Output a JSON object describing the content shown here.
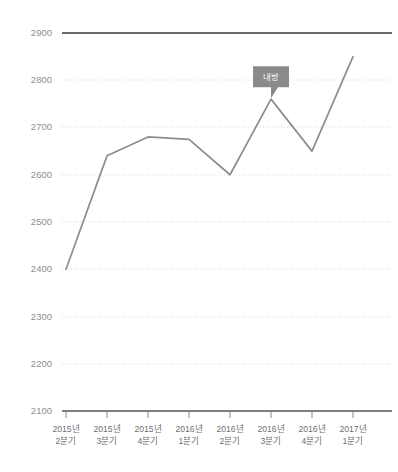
{
  "chart_data": {
    "type": "line",
    "title": "",
    "subtitle": "",
    "xlabel": "",
    "ylabel": "",
    "categories": [
      "2015년\n2분기",
      "2015년\n3분기",
      "2015년\n4분기",
      "2016년\n1분기",
      "2016년\n2분기",
      "2016년\n3분기",
      "2016년\n4분기",
      "2017년\n1분기"
    ],
    "categories_line1": [
      "2015년",
      "2015년",
      "2015년",
      "2016년",
      "2016년",
      "2016년",
      "2016년",
      "2017년"
    ],
    "categories_line2": [
      "2분기",
      "3분기",
      "4분기",
      "1분기",
      "2분기",
      "3분기",
      "4분기",
      "1분기"
    ],
    "values": [
      2400,
      2640,
      2680,
      2675,
      2600,
      2760,
      2650,
      2850
    ],
    "series": [
      {
        "name": "내방",
        "values": [
          2400,
          2640,
          2680,
          2675,
          2600,
          2760,
          2650,
          2850
        ]
      }
    ],
    "ylim": [
      2100,
      2900
    ],
    "ytick_values": [
      2100,
      2200,
      2300,
      2400,
      2500,
      2600,
      2700,
      2800,
      2900
    ],
    "ytick_labels": [
      "2100",
      "2200",
      "2300",
      "2400",
      "2500",
      "2600",
      "2700",
      "2800",
      "2900"
    ],
    "ystep": 100,
    "grid": true,
    "grid_style": "dotted-horizontal",
    "legend": false,
    "legend_position": "none",
    "annotations": [
      {
        "label": "내방",
        "attached_to_index": 5,
        "attached_to_value": 2760,
        "shape": "callout-bubble"
      }
    ]
  },
  "colors": {
    "line": "#8d8d8d",
    "grid": "#d9d9d9",
    "axis": "#555555",
    "top_rule": "#6b6b6b",
    "tooltip_bg": "#8a8a8a",
    "tooltip_text": "#ffffff",
    "ytick_text": "#8e8e8e",
    "xtick_text": "#6f6f6f",
    "background": "#ffffff"
  }
}
